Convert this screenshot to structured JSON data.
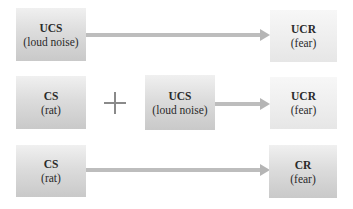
{
  "diagram": {
    "rows": [
      {
        "source": {
          "title": "UCS",
          "subtitle": "(loud noise)"
        },
        "target": {
          "title": "UCR",
          "subtitle": "(fear)"
        }
      },
      {
        "source": {
          "title": "CS",
          "subtitle": "(rat)"
        },
        "operator": "+",
        "paired": {
          "title": "UCS",
          "subtitle": "(loud noise)"
        },
        "target": {
          "title": "UCR",
          "subtitle": "(fear)"
        }
      },
      {
        "source": {
          "title": "CS",
          "subtitle": "(rat)"
        },
        "target": {
          "title": "CR",
          "subtitle": "(fear)"
        }
      }
    ]
  }
}
